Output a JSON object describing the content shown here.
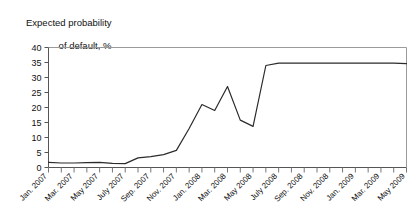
{
  "chart_data": {
    "type": "line",
    "title": "Expected probability of default, %",
    "title_line1": "Expected probability",
    "title_line2": "of default, %",
    "xlabel": "",
    "ylabel": "Expected probability of default, %",
    "ylim": [
      0,
      40
    ],
    "yticks": [
      0,
      5,
      10,
      15,
      20,
      25,
      30,
      35,
      40
    ],
    "ytick_labels": [
      "0",
      "5",
      "10",
      "15",
      "20",
      "25",
      "30",
      "35",
      "40"
    ],
    "grid": false,
    "legend": "none",
    "line_color": "#2b2b2b",
    "axis_color": "#9a9a9a",
    "categories": [
      "Jan. 2007",
      "Feb. 2007",
      "Mar. 2007",
      "Apr. 2007",
      "May 2007",
      "June 2007",
      "July 2007",
      "Aug. 2007",
      "Sep. 2007",
      "Oct. 2007",
      "Nov. 2007",
      "Dec. 2007",
      "Jan. 2008",
      "Feb. 2008",
      "Mar. 2008",
      "Apr. 2008",
      "May 2008",
      "June 2008",
      "July 2008",
      "Aug. 2008",
      "Sep. 2008",
      "Oct. 2008",
      "Nov. 2008",
      "Dec. 2008",
      "Jan. 2009",
      "Feb. 2009",
      "Mar. 2009",
      "Apr. 2009",
      "May 2009"
    ],
    "xtick_labels": [
      "Jan. 2007",
      "Mar. 2007",
      "May 2007",
      "July 2007",
      "Sep. 2007",
      "Nov. 2007",
      "Jan. 2008",
      "Mar. 2008",
      "May 2008",
      "July 2008",
      "Sep. 2008",
      "Nov. 2008",
      "Jan. 2009",
      "Mar. 2009",
      "May 2009"
    ],
    "xtick_indices": [
      0,
      2,
      4,
      6,
      8,
      10,
      12,
      14,
      16,
      18,
      20,
      22,
      24,
      26,
      28
    ],
    "series": [
      {
        "name": "Expected probability of default",
        "values": [
          1.7,
          1.5,
          1.5,
          1.6,
          1.7,
          1.4,
          1.3,
          3.2,
          3.6,
          4.3,
          5.7,
          13.0,
          21.0,
          19.0,
          27.0,
          15.8,
          13.7,
          34.0,
          34.8,
          34.8,
          34.8,
          34.8,
          34.8,
          34.8,
          34.8,
          34.8,
          34.8,
          34.8,
          34.6
        ]
      }
    ]
  }
}
